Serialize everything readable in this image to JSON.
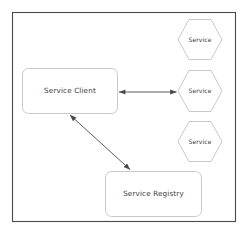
{
  "diagram": {
    "frame": {
      "stroke": "#4a4a4a",
      "fill": "#ffffff"
    },
    "style": {
      "shape_stroke": "#c9c9c9",
      "shape_fill": "#ffffff",
      "arrow_stroke": "#5a5a5a",
      "text_color": "#3a3a3a"
    },
    "nodes": [
      {
        "id": "service-client",
        "shape": "rounded-rect",
        "label": "Service Client",
        "x": 22,
        "y": 68,
        "width": 95,
        "height": 45
      },
      {
        "id": "service-registry",
        "shape": "rounded-rect",
        "label": "Service Registry",
        "x": 105,
        "y": 171,
        "width": 96,
        "height": 45
      },
      {
        "id": "service-instance-1",
        "shape": "hexagon",
        "label": "Service",
        "x": 178,
        "y": 19,
        "width": 44,
        "height": 41
      },
      {
        "id": "service-instance-2",
        "shape": "hexagon",
        "label": "Service",
        "x": 178,
        "y": 70,
        "width": 44,
        "height": 42
      },
      {
        "id": "service-instance-3",
        "shape": "hexagon",
        "label": "Service",
        "x": 178,
        "y": 121,
        "width": 44,
        "height": 41
      }
    ],
    "edges": [
      {
        "id": "client-to-service",
        "from": "service-client",
        "to": "service-instance-2",
        "arrowheads": "both",
        "x1": 118,
        "y1": 92,
        "x2": 177,
        "y2": 92
      },
      {
        "id": "client-to-registry",
        "from": "service-client",
        "to": "service-registry",
        "arrowheads": "both",
        "x1": 70,
        "y1": 114,
        "x2": 130,
        "y2": 170
      }
    ]
  }
}
